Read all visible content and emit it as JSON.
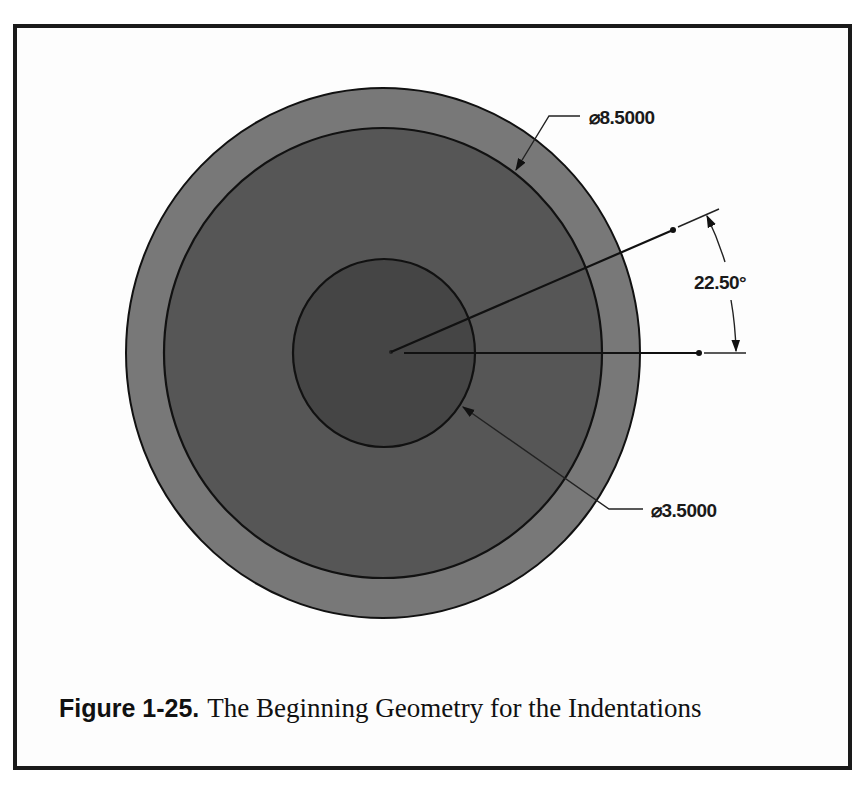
{
  "figure": {
    "label": "Figure 1-25.",
    "title": "The Beginning Geometry for the Indentations"
  },
  "diagram": {
    "outer_circle": {
      "cx": 383,
      "cy": 353,
      "rx": 257,
      "ry": 265,
      "fill": "#787878"
    },
    "middle_circle": {
      "cx": 383,
      "cy": 353,
      "rx": 219,
      "ry": 225,
      "fill": "#565656"
    },
    "inner_circle": {
      "cx": 384,
      "cy": 353,
      "rx": 91,
      "ry": 94,
      "fill": "#454545"
    },
    "dimensions": {
      "outer_diameter": "⌀8.5000",
      "inner_diameter": "⌀3.5000",
      "angle": "22.50°"
    },
    "line_color": "#111111"
  }
}
